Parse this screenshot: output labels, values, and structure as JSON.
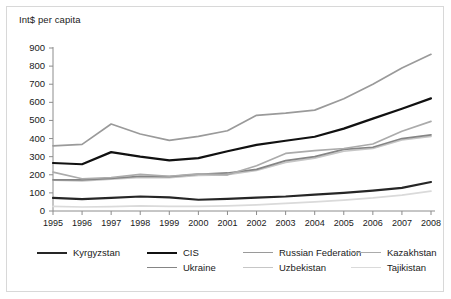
{
  "chart_data": {
    "type": "line",
    "title": "",
    "subtitle": "",
    "ylabel": "Int$ per capita",
    "xlabel": "",
    "ylim": [
      0,
      900
    ],
    "ytick_step": 100,
    "yticks": [
      "900",
      "800",
      "700",
      "600",
      "500",
      "400",
      "300",
      "200",
      "100",
      "0"
    ],
    "grid": false,
    "legend_position": "bottom",
    "categories": [
      "1995",
      "1996",
      "1997",
      "1998",
      "1999",
      "2000",
      "2001",
      "2002",
      "2003",
      "2004",
      "2005",
      "2006",
      "2007",
      "2008"
    ],
    "series": [
      {
        "name": "Kyrgyzstan",
        "color": "#262626",
        "width": 2.2,
        "values": [
          72,
          66,
          73,
          80,
          75,
          62,
          67,
          74,
          80,
          90,
          100,
          113,
          128,
          160
        ]
      },
      {
        "name": "CIS",
        "color": "#111111",
        "width": 2.2,
        "values": [
          265,
          258,
          325,
          300,
          280,
          292,
          330,
          365,
          388,
          410,
          455,
          510,
          565,
          622
        ]
      },
      {
        "name": "Russian Federation",
        "color": "#9a9a9a",
        "width": 1.7,
        "values": [
          360,
          368,
          480,
          425,
          390,
          412,
          443,
          528,
          540,
          557,
          620,
          700,
          790,
          865
        ]
      },
      {
        "name": "Kazakhstan",
        "color": "#ababab",
        "width": 1.7,
        "values": [
          215,
          178,
          185,
          202,
          192,
          205,
          200,
          250,
          318,
          333,
          345,
          370,
          440,
          495
        ]
      },
      {
        "name": "Ukraine",
        "color": "#858585",
        "width": 1.7,
        "values": [
          172,
          172,
          180,
          192,
          190,
          203,
          210,
          230,
          278,
          300,
          340,
          352,
          400,
          420
        ]
      },
      {
        "name": "Uzbekistan",
        "color": "#c6c6c6",
        "width": 1.7,
        "values": [
          170,
          166,
          176,
          186,
          184,
          196,
          200,
          224,
          268,
          292,
          330,
          345,
          392,
          412
        ]
      },
      {
        "name": "Tajikistan",
        "color": "#dadada",
        "width": 1.7,
        "values": [
          25,
          22,
          24,
          28,
          26,
          25,
          28,
          34,
          42,
          50,
          60,
          72,
          88,
          110
        ]
      }
    ]
  },
  "legend": {
    "rows": [
      [
        {
          "label": "Kyrgyzstan",
          "color": "#262626",
          "width": 2.4,
          "x": 16
        },
        {
          "label": "CIS",
          "color": "#111111",
          "width": 2.4,
          "x": 126
        },
        {
          "label": "Russian Federation",
          "color": "#9a9a9a",
          "width": 1.6,
          "x": 222
        },
        {
          "label": "Kazakhstan",
          "color": "#ababab",
          "width": 1.6,
          "x": 330
        }
      ],
      [
        {
          "label": "Ukraine",
          "color": "#858585",
          "width": 1.6,
          "x": 126
        },
        {
          "label": "Uzbekistan",
          "color": "#c6c6c6",
          "width": 1.6,
          "x": 222
        },
        {
          "label": "Tajikistan",
          "color": "#dadada",
          "width": 1.6,
          "x": 330
        }
      ]
    ]
  },
  "axis": {
    "line_color": "#8c8c8c",
    "tick_color": "#8c8c8c"
  }
}
